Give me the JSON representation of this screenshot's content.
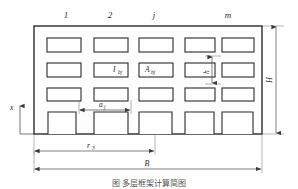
{
  "figure": {
    "caption": "图   多层框架计算简图",
    "type": "structural-frame-elevation"
  },
  "column_labels": [
    {
      "id": "col-1",
      "text": "1",
      "x": 66,
      "y": 18
    },
    {
      "id": "col-2",
      "text": "2",
      "x": 110,
      "y": 18
    },
    {
      "id": "col-j",
      "text": "j",
      "x": 154,
      "y": 18
    },
    {
      "id": "col-m",
      "text": "m",
      "x": 228,
      "y": 18
    }
  ],
  "annotations": {
    "inertia": {
      "symbol": "I",
      "subscript": "bj",
      "x": 115,
      "y": 72
    },
    "area": {
      "symbol": "A",
      "subscript": "bj",
      "x": 140,
      "y": 71
    },
    "bay_width": {
      "symbol": "a",
      "subscript": "j",
      "x": 99,
      "y": 106
    },
    "story_height": {
      "symbol": "h",
      "x": 215,
      "y": 72
    },
    "total_height": {
      "symbol": "H",
      "x": 276,
      "y": 74
    },
    "distance_r": {
      "symbol": "r",
      "subscript": "3",
      "x": 87,
      "y": 146
    },
    "total_width": {
      "symbol": "B",
      "x": 147,
      "y": 164
    },
    "axis_x": {
      "symbol": "x",
      "x": 9,
      "y": 108
    }
  },
  "geometry": {
    "wall": {
      "x": 34,
      "y": 26,
      "width": 228,
      "height": 108
    },
    "columns_count": 5,
    "rows_count": 4,
    "openings": [
      {
        "x": 47,
        "y": 38,
        "width": 34,
        "height": 14
      },
      {
        "x": 94,
        "y": 38,
        "width": 34,
        "height": 14
      },
      {
        "x": 139,
        "y": 38,
        "width": 34,
        "height": 14
      },
      {
        "x": 185,
        "y": 38,
        "width": 30,
        "height": 14
      },
      {
        "x": 222,
        "y": 38,
        "width": 32,
        "height": 14
      },
      {
        "x": 47,
        "y": 63,
        "width": 34,
        "height": 14
      },
      {
        "x": 94,
        "y": 63,
        "width": 34,
        "height": 14
      },
      {
        "x": 139,
        "y": 63,
        "width": 34,
        "height": 14
      },
      {
        "x": 185,
        "y": 63,
        "width": 30,
        "height": 14
      },
      {
        "x": 222,
        "y": 63,
        "width": 32,
        "height": 14
      },
      {
        "x": 47,
        "y": 88,
        "width": 34,
        "height": 13
      },
      {
        "x": 94,
        "y": 88,
        "width": 34,
        "height": 13
      },
      {
        "x": 139,
        "y": 88,
        "width": 34,
        "height": 13
      },
      {
        "x": 185,
        "y": 88,
        "width": 30,
        "height": 13
      },
      {
        "x": 222,
        "y": 88,
        "width": 32,
        "height": 13
      }
    ],
    "bottom_openings": [
      {
        "x": 48,
        "y": 112,
        "width": 28,
        "height": 22
      },
      {
        "x": 94,
        "y": 112,
        "width": 34,
        "height": 22
      },
      {
        "x": 139,
        "y": 112,
        "width": 33,
        "height": 22
      },
      {
        "x": 185,
        "y": 112,
        "width": 29,
        "height": 22
      },
      {
        "x": 222,
        "y": 112,
        "width": 31,
        "height": 22
      }
    ]
  },
  "dimensions": {
    "r3": {
      "start_x": 34,
      "end_x": 155,
      "y": 151
    },
    "B": {
      "start_x": 34,
      "end_x": 262,
      "y": 169
    },
    "H": {
      "x": 276,
      "start_y": 26,
      "end_y": 134
    },
    "h": {
      "x": 212,
      "start_y": 56,
      "end_y": 84
    },
    "aj": {
      "y": 110,
      "start_x": 79,
      "end_x": 131
    }
  }
}
